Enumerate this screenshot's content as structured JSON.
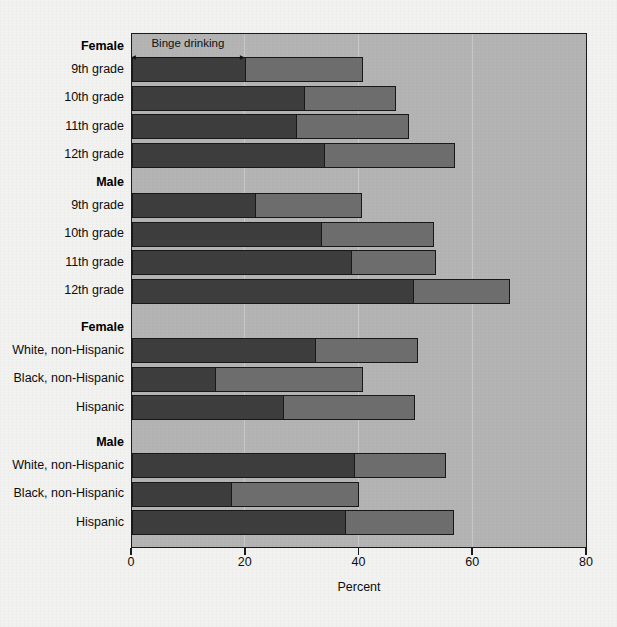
{
  "chart_data": {
    "type": "bar",
    "orientation": "horizontal",
    "stacked": true,
    "title": "",
    "xlabel": "Percent",
    "ylabel": "",
    "xlim": [
      0,
      80
    ],
    "xticks": [
      0,
      20,
      40,
      60,
      80
    ],
    "xtick_labels": [
      "0",
      "20",
      "40",
      "60",
      "80"
    ],
    "grid": true,
    "legend_position": "none",
    "annotation": {
      "label": "Binge drinking",
      "from": 0,
      "to": 20
    },
    "series": [
      {
        "name": "Binge drinking",
        "color": "#3e3e3e"
      },
      {
        "name": "Current drinking (remainder)",
        "color": "#6e6e6e"
      }
    ],
    "groups": [
      {
        "header": "Female",
        "rows": [
          {
            "label": "9th grade",
            "binge": 20.0,
            "total": 40.6
          },
          {
            "label": "10th grade",
            "binge": 30.5,
            "total": 46.5
          },
          {
            "label": "11th grade",
            "binge": 29.0,
            "total": 48.7
          },
          {
            "label": "12th grade",
            "binge": 33.9,
            "total": 56.8
          }
        ]
      },
      {
        "header": "Male",
        "rows": [
          {
            "label": "9th grade",
            "binge": 21.9,
            "total": 40.4
          },
          {
            "label": "10th grade",
            "binge": 33.5,
            "total": 53.1
          },
          {
            "label": "11th grade",
            "binge": 38.8,
            "total": 53.4
          },
          {
            "label": "12th grade",
            "binge": 49.6,
            "total": 66.5
          }
        ]
      },
      {
        "header": "Female",
        "rows": [
          {
            "label": "White, non-Hispanic",
            "binge": 32.3,
            "total": 50.2
          },
          {
            "label": "Black, non-Hispanic",
            "binge": 14.8,
            "total": 40.7
          },
          {
            "label": "Hispanic",
            "binge": 26.8,
            "total": 49.8
          }
        ]
      },
      {
        "header": "Male",
        "rows": [
          {
            "label": "White, non-Hispanic",
            "binge": 39.3,
            "total": 55.2
          },
          {
            "label": "Black, non-Hispanic",
            "binge": 17.6,
            "total": 40.0
          },
          {
            "label": "Hispanic",
            "binge": 37.7,
            "total": 56.6
          }
        ]
      }
    ],
    "colors": {
      "binge": "#3e3e3e",
      "current": "#6e6e6e",
      "plot_background": "#b4b4b4",
      "page_background": "#f2f2f1",
      "frame": "#1a1a1a",
      "gridline": "#c9c9c9"
    }
  }
}
